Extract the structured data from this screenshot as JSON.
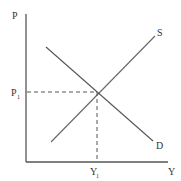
{
  "diagram": {
    "type": "supply-demand",
    "axes": {
      "y_label": "P",
      "x_label": "Y"
    },
    "curves": {
      "supply_label": "S",
      "demand_label": "D"
    },
    "equilibrium": {
      "price_label": "P",
      "price_sub": "1",
      "quantity_label": "Y",
      "quantity_sub": "1"
    },
    "colors": {
      "axis": "#555555",
      "curve": "#666666",
      "guide": "#555555",
      "text": "#333333"
    }
  }
}
